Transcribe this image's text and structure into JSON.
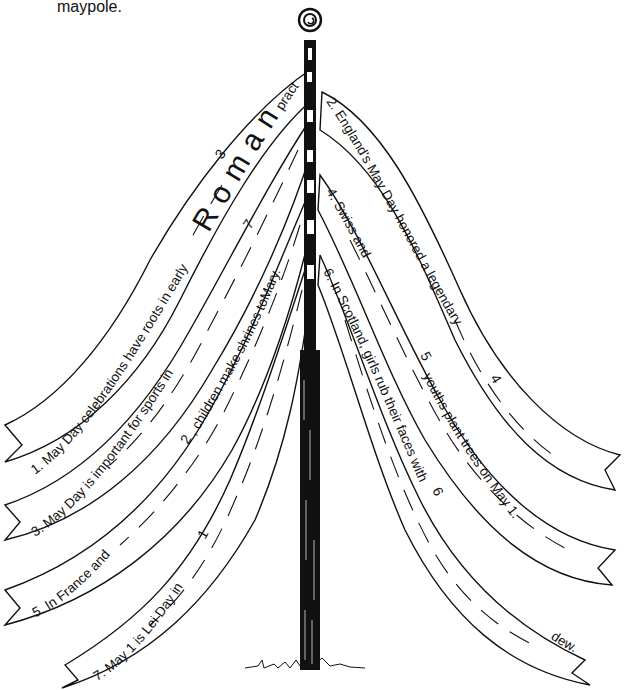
{
  "intro_text": "maypole.",
  "ribbons": [
    {
      "id": 1,
      "side": "left",
      "text_before": "1. May  Day celebrations have roots in early",
      "answer_letters": [
        "R",
        "o",
        "m",
        "a",
        "n"
      ],
      "text_after": "practices.",
      "answer_number": "3"
    },
    {
      "id": 2,
      "side": "right",
      "text": "2. England's May Day honored a legendary",
      "answer_number": "4"
    },
    {
      "id": 3,
      "side": "left",
      "text": "3. May Day is important for sports in",
      "answer_number": "7"
    },
    {
      "id": 4,
      "side": "right",
      "text_before": "4. Swiss and",
      "answer_number": "5",
      "text_after": "youths plant trees on May 1."
    },
    {
      "id": 5,
      "side": "left",
      "text_before": "5. In France and",
      "answer_number": "2",
      "text_after": ", children make shrines toMary."
    },
    {
      "id": 6,
      "side": "right",
      "text_before": "6. In Scotland, girls rub their faces with",
      "answer_number": "6",
      "text_after": "dew."
    },
    {
      "id": 7,
      "side": "left",
      "text": "7. May 1 is Lei Day in",
      "answer_number": "1"
    }
  ],
  "pole": {
    "top_ornament": "spiral-knob",
    "color": "#111111"
  }
}
